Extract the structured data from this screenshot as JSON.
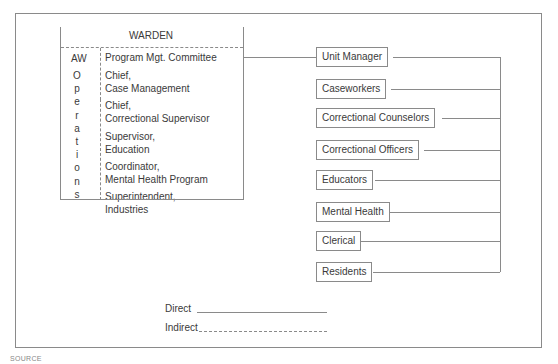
{
  "diagram": {
    "type": "organizational-chart",
    "top": {
      "title": "WARDEN",
      "left_column": {
        "label_top": "AW",
        "vertical_label": "Operations",
        "vertical_letters": [
          "O",
          "p",
          "e",
          "r",
          "a",
          "t",
          "i",
          "o",
          "n",
          "s"
        ]
      },
      "right_column": [
        {
          "line1": "Program Mgt. Committee",
          "line2": ""
        },
        {
          "line1": "Chief,",
          "line2": "Case Management"
        },
        {
          "line1": "Chief,",
          "line2": "Correctional Supervisor"
        },
        {
          "line1": "Supervisor,",
          "line2": "Education"
        },
        {
          "line1": "Coordinator,",
          "line2": "Mental Health Program"
        },
        {
          "line1": "Superintendent,",
          "line2": "Industries"
        }
      ]
    },
    "unit_nodes": [
      {
        "label": "Unit Manager"
      },
      {
        "label": "Caseworkers"
      },
      {
        "label": "Correctional Counselors"
      },
      {
        "label": "Correctional Officers"
      },
      {
        "label": "Educators"
      },
      {
        "label": "Mental Health"
      },
      {
        "label": "Clerical"
      },
      {
        "label": "Residents"
      }
    ],
    "connections": [
      {
        "from": "Program Mgt. Committee",
        "to": "Unit Manager",
        "style": "direct"
      },
      {
        "from": "Unit Manager",
        "to": "unit-bus",
        "style": "direct"
      }
    ],
    "legend": {
      "direct_label": "Direct",
      "indirect_label": "Indirect"
    },
    "colors": {
      "line": "#8a8a8a",
      "text": "#3a3a3a",
      "background": "#ffffff"
    }
  },
  "footer": {
    "source_prefix": "SOURCE"
  }
}
